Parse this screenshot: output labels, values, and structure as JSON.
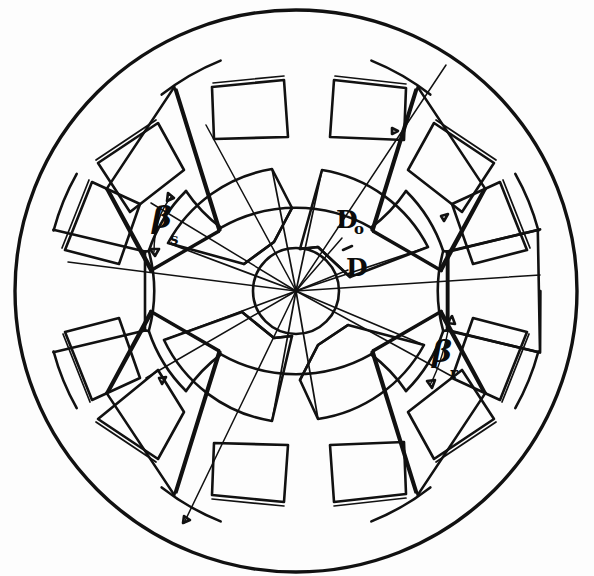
{
  "figure": {
    "kind": "machine-cross-section",
    "background_color": "#fdfdfd",
    "ink_color": "#111111",
    "width": 594,
    "height": 576
  },
  "geometry": {
    "center_x": 296,
    "center_y": 291,
    "outer_radius": 281,
    "yoke_inner_radius": 243,
    "stator_bore_radius": 152,
    "stator_tooth_root_radius": 236,
    "rotor_outer_radius": 145,
    "rotor_root_radius": 78,
    "shaft_radius": 43,
    "stator_pole_count": 6,
    "stator_slot_count": 12,
    "rotor_pole_count": 4,
    "stator_pole_arc_deg": 30,
    "rotor_pole_arc_deg": 32,
    "stator_pole_angles_deg": [
      -60,
      0,
      60,
      120,
      180,
      240
    ],
    "rotor_pole_angles_deg": [
      -115,
      -25,
      65,
      155
    ],
    "coil_angles_deg": [
      -76,
      -44,
      -16,
      16,
      44,
      76,
      104,
      136,
      164,
      196,
      224,
      256
    ]
  },
  "annotations": {
    "outer_diameter": {
      "label": "D",
      "subscript": "o",
      "x": 356,
      "y": 226,
      "leader_from_x": 340,
      "leader_from_y": 238,
      "leader_to_x": 296,
      "leader_to_y": 291,
      "description": "stator outer diameter"
    },
    "bore_diameter": {
      "label": "D",
      "subscript": "",
      "x": 356,
      "y": 272,
      "leader_from_x": 347,
      "leader_from_y": 267,
      "leader_to_x": 296,
      "leader_to_y": 291,
      "description": "stator bore diameter"
    },
    "stator_pole_arc": {
      "label": "β",
      "subscript": "s",
      "x": 158,
      "y": 222,
      "sub_x": 176,
      "sub_y": 238,
      "description": "stator pole arc angle"
    },
    "rotor_pole_arc": {
      "label": "β",
      "subscript": "r",
      "x": 438,
      "y": 356,
      "sub_x": 456,
      "sub_y": 371,
      "description": "rotor pole arc angle"
    },
    "dash_mark": {
      "x": 347,
      "y": 248,
      "description": "short tick between Do and D leader lines"
    }
  },
  "layers": [
    {
      "name": "stator-outer-circle",
      "type": "circle"
    },
    {
      "name": "stator-yoke-inner-arcs",
      "type": "arc-set"
    },
    {
      "name": "stator-teeth",
      "type": "poles"
    },
    {
      "name": "stator-coils",
      "type": "rect-set"
    },
    {
      "name": "rotor-core",
      "type": "salient-rotor"
    },
    {
      "name": "shaft-circle",
      "type": "circle"
    },
    {
      "name": "diameter-leaders",
      "type": "lines"
    },
    {
      "name": "angle-arrows",
      "type": "arrows"
    }
  ]
}
